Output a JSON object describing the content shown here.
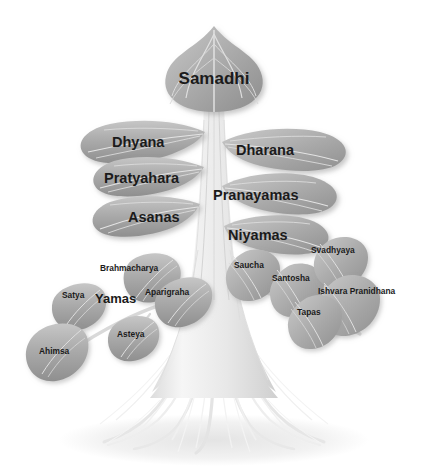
{
  "diagram": {
    "background_color": "#ffffff",
    "leaf_fill": "#a9a9a9",
    "leaf_fill_light": "#c2c2c2",
    "vein_color": "#e2e2e2",
    "root_color": "#ededed",
    "label_color": "#1b1b1b",
    "shadow_color": "#bdbdbd"
  },
  "crown": {
    "top_leaf": "Samadhi"
  },
  "branches_left": [
    {
      "label": "Dhyana"
    },
    {
      "label": "Pratyahara"
    },
    {
      "label": "Asanas"
    }
  ],
  "branches_right": [
    {
      "label": "Dharana"
    },
    {
      "label": "Pranayamas"
    },
    {
      "label": "Niyamas"
    }
  ],
  "yamas": {
    "label": "Yamas",
    "leaves": [
      {
        "label": "Ahimsa"
      },
      {
        "label": "Satya"
      },
      {
        "label": "Asteya"
      },
      {
        "label": "Brahmacharya"
      },
      {
        "label": "Aparigraha"
      }
    ]
  },
  "niyamas": {
    "label": "Niyamas",
    "leaves": [
      {
        "label": "Saucha"
      },
      {
        "label": "Santosha"
      },
      {
        "label": "Tapas"
      },
      {
        "label": "Svadhyaya"
      },
      {
        "label": "Ishvara Pranidhana"
      }
    ]
  }
}
